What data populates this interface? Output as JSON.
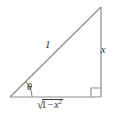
{
  "figure": {
    "background_color": "#ffffff",
    "line_color": "#8c8c8c",
    "text_color": "#2b2b2b",
    "labels": {
      "hypotenuse": "1",
      "opposite_side": "x",
      "angle": "θ",
      "adjacent_radical_sign": "√",
      "adjacent_one": "1",
      "adjacent_minus": "−",
      "adjacent_variable": "x",
      "adjacent_exponent": "2",
      "adjacent_full": "√(1 − x²)"
    },
    "geometry": {
      "vertex_left": [
        10,
        97
      ],
      "vertex_right": [
        101,
        97
      ],
      "vertex_apex": [
        101,
        7
      ],
      "right_angle_marker": [
        91,
        87,
        9,
        9
      ],
      "angle_arc_radius": 20,
      "angle_degrees": 45
    }
  }
}
